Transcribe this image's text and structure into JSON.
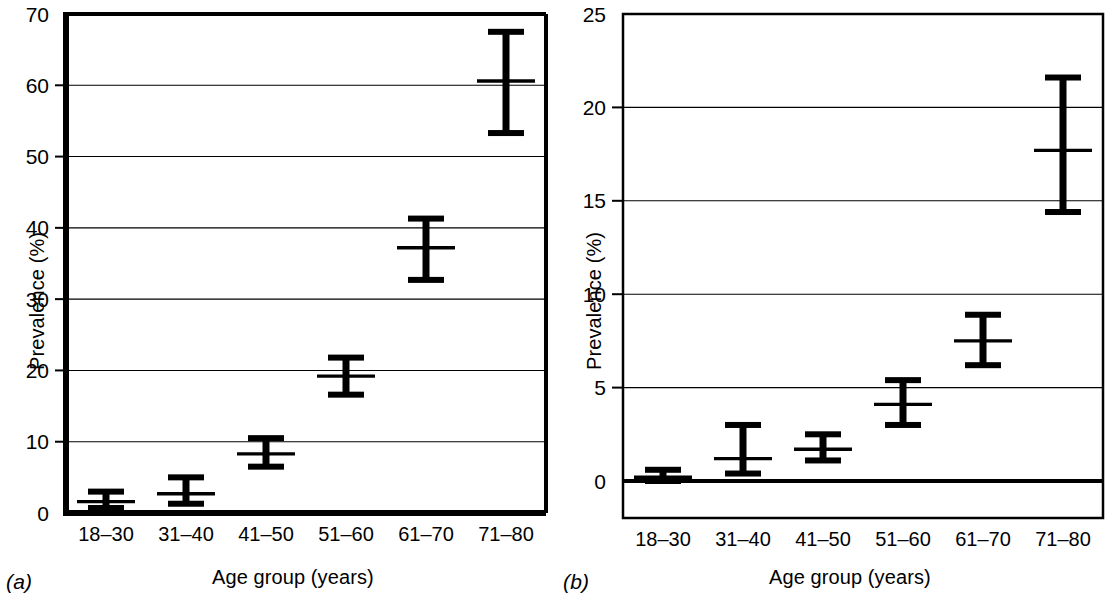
{
  "figure": {
    "panels": [
      {
        "key": "a",
        "label": "(a)",
        "xlabel": "Age group (years)",
        "ylabel": "Prevalence (%)"
      },
      {
        "key": "b",
        "label": "(b)",
        "xlabel": "Age group (years)",
        "ylabel": "Prevalence (%)"
      }
    ]
  },
  "chart_data": [
    {
      "type": "scatter",
      "panel": "a",
      "title": "",
      "xlabel": "Age group (years)",
      "ylabel": "Prevalence (%)",
      "categories": [
        "18–30",
        "31–40",
        "41–50",
        "51–60",
        "61–70",
        "71–80"
      ],
      "values": [
        1.6,
        2.7,
        8.3,
        19.2,
        37.2,
        60.6
      ],
      "error_low": [
        0.7,
        1.3,
        6.5,
        16.6,
        32.7,
        53.3
      ],
      "error_high": [
        3.0,
        5.0,
        10.5,
        21.8,
        41.3,
        67.5
      ],
      "ylim": [
        0,
        70
      ],
      "yticks": [
        0,
        10,
        20,
        30,
        40,
        50,
        60,
        70
      ],
      "ytick_labels": [
        "0",
        "10",
        "20",
        "30",
        "40",
        "50",
        "60",
        "70"
      ],
      "grid": true,
      "legend": "none",
      "marker": "mean-with-error-bars"
    },
    {
      "type": "scatter",
      "panel": "b",
      "title": "",
      "xlabel": "Age group (years)",
      "ylabel": "Prevalence (%)",
      "categories": [
        "18–30",
        "31–40",
        "41–50",
        "51–60",
        "61–70",
        "71–80"
      ],
      "values": [
        0.2,
        1.2,
        1.7,
        4.1,
        7.5,
        17.7
      ],
      "error_low": [
        0.0,
        0.4,
        1.1,
        3.0,
        6.2,
        14.4
      ],
      "error_high": [
        0.6,
        3.0,
        2.5,
        5.4,
        8.9,
        21.6
      ],
      "ylim": [
        0,
        25
      ],
      "yticks": [
        0,
        5,
        10,
        15,
        20,
        25
      ],
      "ytick_labels": [
        "0",
        "5",
        "10",
        "15",
        "20",
        "25"
      ],
      "grid": true,
      "legend": "none",
      "marker": "mean-with-error-bars"
    }
  ]
}
